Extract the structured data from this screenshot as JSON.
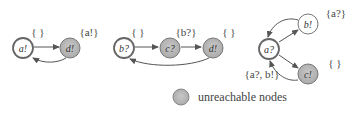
{
  "colors": {
    "background": "#ffffff",
    "edge": "#555555",
    "reachable_fill": "#ffffff",
    "unreachable_fill": "#b8b8b8",
    "node_stroke": "#666666"
  },
  "graphs": [
    {
      "nodes": [
        {
          "id": "g1-a",
          "label": "a!",
          "reachable": true,
          "initial": true,
          "set": "{ }"
        },
        {
          "id": "g1-d",
          "label": "d!",
          "reachable": false,
          "initial": false,
          "set": "{a!}"
        }
      ],
      "edges": [
        {
          "from": "a!",
          "to": "d!"
        },
        {
          "from": "d!",
          "to": "a!"
        }
      ]
    },
    {
      "nodes": [
        {
          "id": "g2-b",
          "label": "b?",
          "reachable": true,
          "initial": true,
          "set": "{ }"
        },
        {
          "id": "g2-c",
          "label": "c?",
          "reachable": false,
          "initial": false,
          "set": "{b?}"
        },
        {
          "id": "g2-d",
          "label": "d!",
          "reachable": false,
          "initial": false,
          "set": "{ }"
        }
      ],
      "edges": [
        {
          "from": "b?",
          "to": "c?"
        },
        {
          "from": "c?",
          "to": "d!"
        },
        {
          "from": "d!",
          "to": "b?"
        }
      ]
    },
    {
      "nodes": [
        {
          "id": "g3-a",
          "label": "a?",
          "reachable": true,
          "initial": true,
          "set": "{a?, b!}"
        },
        {
          "id": "g3-b",
          "label": "b!",
          "reachable": true,
          "initial": false,
          "set": "{a?}"
        },
        {
          "id": "g3-c",
          "label": "c!",
          "reachable": false,
          "initial": false,
          "set": "{ }"
        }
      ],
      "edges": [
        {
          "from": "a?",
          "to": "b!"
        },
        {
          "from": "b!",
          "to": "a?"
        },
        {
          "from": "a?",
          "to": "c!"
        },
        {
          "from": "c!",
          "to": "a?"
        }
      ]
    }
  ],
  "legend": {
    "label": "unreachable nodes"
  }
}
